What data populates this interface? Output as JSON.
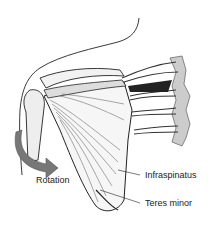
{
  "figure": {
    "labels": {
      "rotation": "Rotation",
      "infraspinatus": "Infraspinatus",
      "teres_minor": "Teres minor"
    },
    "colors": {
      "ink": "#222222",
      "arrow": "#6a6a6a",
      "background": "#ffffff"
    }
  }
}
